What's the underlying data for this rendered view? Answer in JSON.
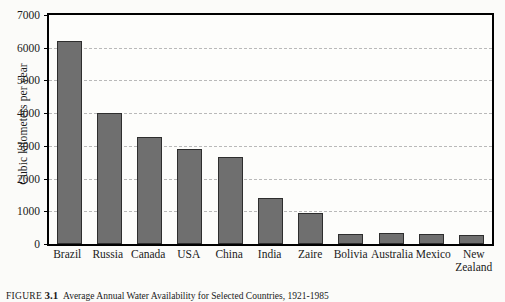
{
  "chart_data": {
    "type": "bar",
    "title": "",
    "xlabel": "",
    "ylabel": "Cubic kilometers per year",
    "ylim": [
      0,
      7000
    ],
    "yticks": [
      0,
      1000,
      2000,
      3000,
      4000,
      5000,
      6000,
      7000
    ],
    "grid": true,
    "legend": false,
    "categories": [
      "Brazil",
      "Russia",
      "Canada",
      "USA",
      "China",
      "India",
      "Zaire",
      "Bolivia",
      "Australia",
      "Mexico",
      "New\nZealand"
    ],
    "values": [
      6220,
      4010,
      3260,
      2900,
      2650,
      1400,
      950,
      320,
      330,
      300,
      270
    ],
    "bar_color": "#6f6f6f",
    "bar_border_color": "#2e2e2e",
    "grid_color": "#b9b9b9",
    "frame_color": "#000000",
    "background": "#fbfbf9"
  },
  "caption": {
    "figure_label": "FIGURE",
    "figure_number": "3.1",
    "text": "Average Annual Water Availability for Selected Countries, 1921-1985"
  }
}
